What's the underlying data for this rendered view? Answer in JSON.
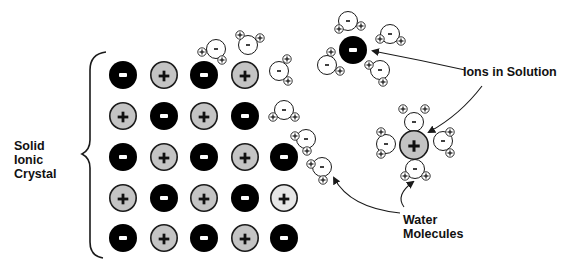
{
  "labels": {
    "crystal": [
      "Solid",
      "Ionic",
      "Crystal"
    ],
    "ions_in_solution": "Ions in Solution",
    "water_molecules": [
      "Water",
      "Molecules"
    ]
  },
  "colors": {
    "anion_fill": "#000000",
    "cation_fill": "#c4c4c4",
    "cation_faded_fill": "#e6e6e6",
    "water_fill": "#ffffff",
    "stroke": "#1a1a1a"
  },
  "symbols": {
    "positive": "+",
    "negative": "-"
  },
  "crystal_grid": {
    "columns_x": [
      123,
      164,
      204,
      245,
      284
    ],
    "rows_y": [
      75,
      116,
      157,
      198,
      238
    ],
    "ion_radius": 14,
    "rows": [
      [
        "-",
        "+",
        "-",
        "+",
        null
      ],
      [
        "+",
        "-",
        "+",
        "-",
        null
      ],
      [
        "-",
        "+",
        "-",
        "+",
        "-"
      ],
      [
        "+",
        "-",
        "+",
        "-",
        "+faded"
      ],
      [
        "-",
        "+",
        "-",
        "+",
        "-"
      ]
    ]
  },
  "water_molecules": [
    {
      "x": 216,
      "y": 49,
      "h": [
        [
          202,
          52
        ],
        [
          222,
          60
        ]
      ]
    },
    {
      "x": 248,
      "y": 45,
      "h": [
        [
          240,
          35
        ],
        [
          260,
          38
        ]
      ]
    },
    {
      "x": 279,
      "y": 71,
      "h": [
        [
          287,
          59
        ],
        [
          288,
          81
        ]
      ]
    },
    {
      "x": 284,
      "y": 110,
      "h": [
        [
          273,
          117
        ],
        [
          295,
          117
        ]
      ]
    },
    {
      "x": 306,
      "y": 139,
      "h": [
        [
          295,
          136
        ],
        [
          307,
          151
        ]
      ]
    },
    {
      "x": 322,
      "y": 167,
      "h": [
        [
          311,
          164
        ],
        [
          323,
          180
        ]
      ]
    },
    {
      "x": 348,
      "y": 21,
      "h": [
        [
          339,
          29
        ],
        [
          361,
          26
        ]
      ]
    },
    {
      "x": 390,
      "y": 34,
      "h": [
        [
          380,
          39
        ],
        [
          401,
          41
        ]
      ]
    },
    {
      "x": 327,
      "y": 65,
      "h": [
        [
          331,
          52
        ],
        [
          340,
          71
        ]
      ]
    },
    {
      "x": 380,
      "y": 70,
      "h": [
        [
          369,
          65
        ],
        [
          383,
          82
        ]
      ]
    },
    {
      "x": 414,
      "y": 122,
      "h": [
        [
          403,
          109
        ],
        [
          425,
          109
        ]
      ]
    },
    {
      "x": 386,
      "y": 144,
      "h": [
        [
          381,
          132
        ],
        [
          381,
          154
        ]
      ]
    },
    {
      "x": 443,
      "y": 141,
      "h": [
        [
          450,
          132
        ],
        [
          450,
          153
        ]
      ]
    },
    {
      "x": 415,
      "y": 169,
      "h": [
        [
          405,
          176
        ],
        [
          426,
          176
        ]
      ]
    }
  ],
  "solution_ions": [
    {
      "x": 353,
      "y": 50,
      "r": 14,
      "sign": "-"
    },
    {
      "x": 414,
      "y": 145,
      "r": 15,
      "sign": "+"
    }
  ],
  "arrows": [
    {
      "name": "arrow-to-anion",
      "d": "M 465 70 Q 420 60 373 51",
      "tip": [
        373,
        51
      ]
    },
    {
      "name": "arrow-to-cation",
      "d": "M 482 86 Q 460 115 429 132",
      "tip": [
        429,
        132
      ]
    },
    {
      "name": "arrow-to-edge-water",
      "d": "M 400 213 Q 350 208 334 178",
      "tip": [
        333,
        178
      ]
    },
    {
      "name": "arrow-to-cation-water",
      "d": "M 404 207 Q 395 195 413 182",
      "tip": [
        414,
        181
      ]
    }
  ]
}
